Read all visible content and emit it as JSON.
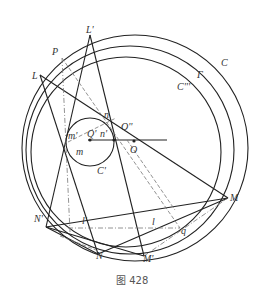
{
  "figure": {
    "caption": "图 428",
    "labels": {
      "L_prime": "L'",
      "P": "P",
      "L": "L",
      "C": "C",
      "Gamma": "Γ",
      "C_triple": "C'''",
      "n": "n",
      "O_double": "O''",
      "m_prime": "m'",
      "Q_prime": "Q'",
      "n_prime": "n'",
      "O": "O",
      "m": "m",
      "C_prime": "C'",
      "N_prime": "N'",
      "l_prime": "l'",
      "l": "l",
      "q": "q",
      "M": "M",
      "N": "N",
      "M_prime": "M'"
    }
  }
}
